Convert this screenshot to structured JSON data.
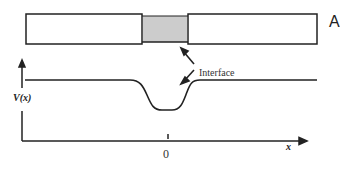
{
  "figure": {
    "panel_label": "A",
    "interface_label": "Interface",
    "y_axis_label": "V(x)",
    "x_axis_label": "x",
    "origin_tick_label": "0"
  },
  "colors": {
    "stroke": "#222222",
    "barrier_fill": "#cccccc",
    "background": "#ffffff"
  }
}
